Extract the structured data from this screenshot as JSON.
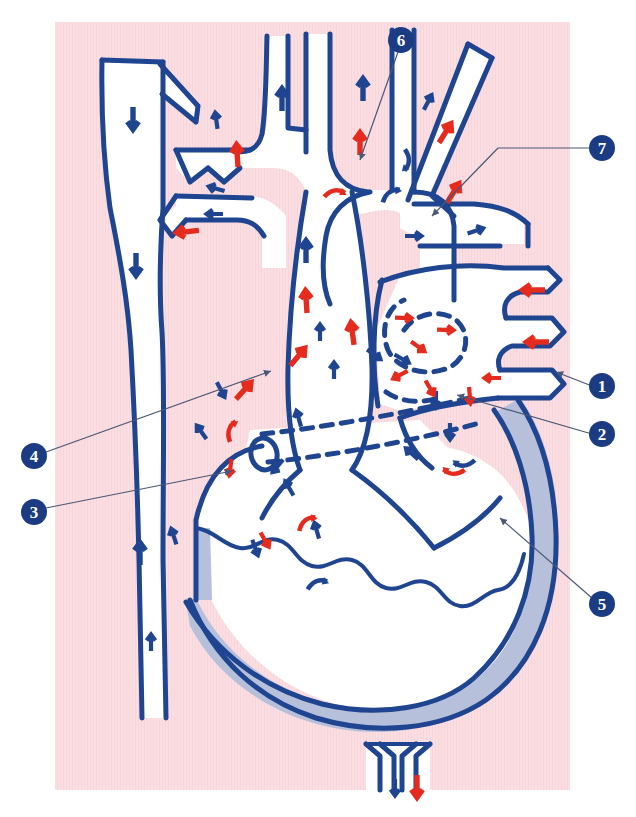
{
  "figure": {
    "kind": "anatomical-diagram",
    "panel": {
      "x": 55,
      "y": 22,
      "width": 515,
      "height": 768,
      "fill": "#fadee2"
    },
    "colors": {
      "background": "#ffffff",
      "panel_pink": "#fadee2",
      "vessel_outline_navy": "#1f4490",
      "oxygenated_red": "#e42b1e",
      "deoxygenated_navy": "#1f4490",
      "lumen_white": "#ffffff",
      "myocardium_gray_blue": "#b6c0da",
      "label_circle_navy": "#1b3b82",
      "label_text_white": "#ffffff",
      "leader_line_gray": "#4a5878"
    }
  },
  "callouts": [
    {
      "id": "1",
      "label": "1",
      "cx": 602,
      "cy": 386,
      "leader": {
        "x1": 592,
        "y1": 386,
        "x2": 556,
        "y2": 372
      }
    },
    {
      "id": "2",
      "label": "2",
      "cx": 602,
      "cy": 434,
      "leader": {
        "x1": 592,
        "y1": 434,
        "x2": 457,
        "y2": 395
      }
    },
    {
      "id": "3",
      "label": "3",
      "cx": 34,
      "cy": 512,
      "leader": {
        "x1": 46,
        "y1": 508,
        "x2": 232,
        "y2": 471
      }
    },
    {
      "id": "4",
      "label": "4",
      "cx": 34,
      "cy": 456,
      "leader": {
        "x1": 46,
        "y1": 452,
        "x2": 271,
        "y2": 371
      }
    },
    {
      "id": "5",
      "label": "5",
      "cx": 602,
      "cy": 604,
      "leader": {
        "x1": 592,
        "y1": 598,
        "x2": 500,
        "y2": 518
      }
    },
    {
      "id": "6",
      "label": "6",
      "cx": 401,
      "cy": 40,
      "leader": {
        "x1": 398,
        "y1": 52,
        "x2": 360,
        "y2": 160
      }
    },
    {
      "id": "7",
      "label": "7",
      "cx": 602,
      "cy": 148,
      "leader": {
        "x1": 590,
        "y1": 148,
        "x2": 432,
        "y2": 216
      }
    }
  ],
  "flow_arrows": {
    "legend": {
      "red": "oxygenated blood flow",
      "navy": "deoxygenated blood flow"
    },
    "red_count": 26,
    "navy_count": 33
  },
  "structures": [
    {
      "name": "superior-vena-cava-descending-trunk",
      "flow": "navy"
    },
    {
      "name": "aortic-arch",
      "flow": "red"
    },
    {
      "name": "brachiocephalic-trunk",
      "flow": "mixed"
    },
    {
      "name": "left-common-carotid-artery",
      "flow": "mixed"
    },
    {
      "name": "left-subclavian-artery",
      "flow": "mixed"
    },
    {
      "name": "pulmonary-trunk",
      "flow": "navy"
    },
    {
      "name": "right-pulmonary-artery",
      "flow": "navy"
    },
    {
      "name": "left-pulmonary-veins",
      "flow": "red"
    },
    {
      "name": "left-atrium",
      "flow": "red"
    },
    {
      "name": "right-atrium",
      "flow": "navy"
    },
    {
      "name": "left-ventricle",
      "flow": "red"
    },
    {
      "name": "right-ventricle",
      "flow": "navy"
    },
    {
      "name": "interventricular-septum",
      "flow": "none"
    },
    {
      "name": "myocardial-wall",
      "flow": "none"
    },
    {
      "name": "apex-vessels",
      "flow": "mixed"
    },
    {
      "name": "valve-plane-dashed",
      "flow": "none"
    }
  ]
}
